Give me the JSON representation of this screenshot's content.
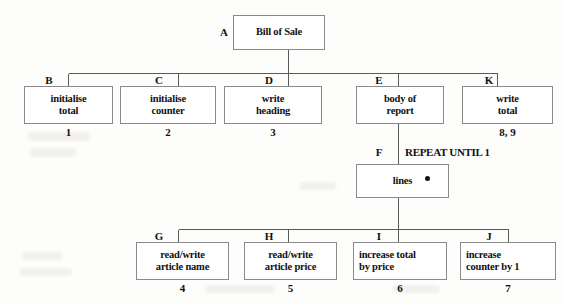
{
  "diagram": {
    "type": "structure-chart",
    "title_node": "Bill of Sale",
    "nodes": [
      {
        "id": "A",
        "letter": "A",
        "lines": [
          "Bill of Sale"
        ],
        "seq": "",
        "align": "center",
        "loop_marker": false
      },
      {
        "id": "B",
        "letter": "B",
        "lines": [
          "initialise",
          "total"
        ],
        "seq": "1",
        "align": "center",
        "loop_marker": false
      },
      {
        "id": "C",
        "letter": "C",
        "lines": [
          "initialise",
          "counter"
        ],
        "seq": "2",
        "align": "center",
        "loop_marker": false
      },
      {
        "id": "D",
        "letter": "D",
        "lines": [
          "write",
          "heading"
        ],
        "seq": "3",
        "align": "center",
        "loop_marker": false
      },
      {
        "id": "E",
        "letter": "E",
        "lines": [
          "body of",
          "report"
        ],
        "seq": "",
        "align": "center",
        "loop_marker": false
      },
      {
        "id": "K",
        "letter": "K",
        "lines": [
          "write",
          "total"
        ],
        "seq": "8, 9",
        "align": "center",
        "loop_marker": false
      },
      {
        "id": "F",
        "letter": "F",
        "lines": [
          "lines"
        ],
        "seq": "",
        "align": "center",
        "loop_marker": true
      },
      {
        "id": "G",
        "letter": "G",
        "lines": [
          "read/write",
          "article name"
        ],
        "seq": "4",
        "align": "center",
        "loop_marker": false
      },
      {
        "id": "H",
        "letter": "H",
        "lines": [
          "read/write",
          "article price"
        ],
        "seq": "5",
        "align": "center",
        "loop_marker": false
      },
      {
        "id": "I",
        "letter": "I",
        "lines": [
          "increase total",
          "by price"
        ],
        "seq": "6",
        "align": "left",
        "loop_marker": false
      },
      {
        "id": "J",
        "letter": "J",
        "lines": [
          "increase",
          "counter by 1"
        ],
        "seq": "7",
        "align": "center",
        "loop_marker": false
      }
    ],
    "annotations": [
      {
        "id": "repeat-until",
        "text": "REPEAT UNTIL 1"
      }
    ],
    "edges": [
      {
        "from": "A",
        "to": "B"
      },
      {
        "from": "A",
        "to": "C"
      },
      {
        "from": "A",
        "to": "D"
      },
      {
        "from": "A",
        "to": "E"
      },
      {
        "from": "A",
        "to": "K"
      },
      {
        "from": "E",
        "to": "F"
      },
      {
        "from": "F",
        "to": "G"
      },
      {
        "from": "F",
        "to": "H"
      },
      {
        "from": "F",
        "to": "I"
      },
      {
        "from": "F",
        "to": "J"
      }
    ],
    "colors": {
      "box_border": "#8a8a8a",
      "box_fill": "#ffffff",
      "text": "#111111",
      "connector": "#5a5a5a",
      "background": "#fdfdfc"
    }
  }
}
